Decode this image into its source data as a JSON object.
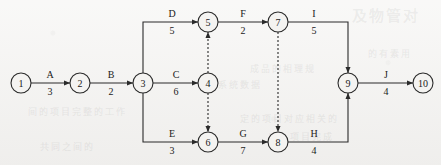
{
  "diagram": {
    "type": "network-diagram",
    "background_color": "#f4f3f1",
    "line_color": "#2a2a2a",
    "watermarks": [
      {
        "text": "及物管对",
        "x": 352,
        "y": 4,
        "size": 15
      },
      {
        "text": "的有素用",
        "x": 368,
        "y": 47,
        "size": 9
      },
      {
        "text": "成品的相理规",
        "x": 250,
        "y": 62,
        "size": 9
      },
      {
        "text": "系统数据",
        "x": 218,
        "y": 78,
        "size": 9
      },
      {
        "text": "间的项目完整的工作",
        "x": 28,
        "y": 105,
        "size": 9
      },
      {
        "text": "定的项目对应相关的",
        "x": 240,
        "y": 112,
        "size": 9
      },
      {
        "text": "以上项目完成",
        "x": 268,
        "y": 130,
        "size": 9
      },
      {
        "text": "共同之间的",
        "x": 40,
        "y": 140,
        "size": 9
      }
    ],
    "nodes": [
      {
        "id": "1",
        "label": "1",
        "cx": 21,
        "cy": 83,
        "r": 10
      },
      {
        "id": "2",
        "label": "2",
        "cx": 80,
        "cy": 83,
        "r": 10
      },
      {
        "id": "3",
        "label": "3",
        "cx": 143,
        "cy": 83,
        "r": 10
      },
      {
        "id": "4",
        "label": "4",
        "cx": 208,
        "cy": 83,
        "r": 10
      },
      {
        "id": "5",
        "label": "5",
        "cx": 208,
        "cy": 22,
        "r": 10
      },
      {
        "id": "6",
        "label": "6",
        "cx": 208,
        "cy": 142,
        "r": 10
      },
      {
        "id": "7",
        "label": "7",
        "cx": 278,
        "cy": 22,
        "r": 10
      },
      {
        "id": "8",
        "label": "8",
        "cx": 278,
        "cy": 142,
        "r": 10
      },
      {
        "id": "9",
        "label": "9",
        "cx": 348,
        "cy": 83,
        "r": 10
      },
      {
        "id": "10",
        "label": "10",
        "cx": 423,
        "cy": 83,
        "r": 10
      }
    ],
    "activities": [
      {
        "name": "A",
        "duration": "3",
        "from": "1",
        "to": "2",
        "label_x": 50,
        "label_y": 78,
        "dur_x": 50,
        "dur_y": 95
      },
      {
        "name": "B",
        "duration": "2",
        "from": "2",
        "to": "3",
        "label_x": 111,
        "label_y": 78,
        "dur_x": 111,
        "dur_y": 95
      },
      {
        "name": "C",
        "duration": "6",
        "from": "3",
        "to": "4",
        "label_x": 176,
        "label_y": 78,
        "dur_x": 176,
        "dur_y": 95
      },
      {
        "name": "D",
        "duration": "5",
        "from": "3",
        "to": "5",
        "label_x": 172,
        "label_y": 17,
        "dur_x": 172,
        "dur_y": 34
      },
      {
        "name": "E",
        "duration": "3",
        "from": "3",
        "to": "6",
        "label_x": 172,
        "label_y": 137,
        "dur_x": 172,
        "dur_y": 154
      },
      {
        "name": "F",
        "duration": "2",
        "from": "5",
        "to": "7",
        "label_x": 243,
        "label_y": 17,
        "dur_x": 243,
        "dur_y": 34
      },
      {
        "name": "G",
        "duration": "7",
        "from": "6",
        "to": "8",
        "label_x": 243,
        "label_y": 137,
        "dur_x": 243,
        "dur_y": 154
      },
      {
        "name": "H",
        "duration": "4",
        "from": "8",
        "to": "9",
        "label_x": 314,
        "label_y": 137,
        "dur_x": 314,
        "dur_y": 154
      },
      {
        "name": "I",
        "duration": "5",
        "from": "7",
        "to": "9",
        "label_x": 314,
        "label_y": 17,
        "dur_x": 314,
        "dur_y": 34
      },
      {
        "name": "J",
        "duration": "4",
        "from": "9",
        "to": "10",
        "label_x": 386,
        "label_y": 78,
        "dur_x": 386,
        "dur_y": 95
      }
    ],
    "dummy_activities": [
      {
        "from": "4",
        "to": "5",
        "label": "dummy-4-5"
      },
      {
        "from": "4",
        "to": "6",
        "label": "dummy-4-6"
      },
      {
        "from": "7",
        "to": "8",
        "label": "dummy-7-8"
      }
    ]
  }
}
